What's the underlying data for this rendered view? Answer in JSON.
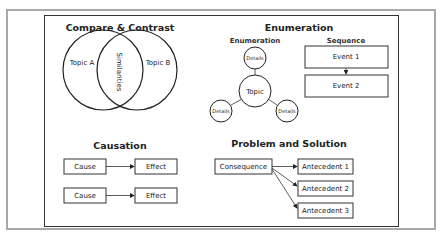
{
  "compare_contrast": {
    "title": "Compare & Contrast",
    "left_label": "Topic A",
    "right_label": "Topic B",
    "overlap_label": "Similarities"
  },
  "enumeration_section": {
    "title": "Enumeration",
    "enumeration": {
      "subtitle": "Enumeration",
      "center": "Topic",
      "details": [
        "Details",
        "Details",
        "Details"
      ]
    },
    "sequence": {
      "subtitle": "Sequence",
      "events": [
        "Event 1",
        "Event 2"
      ]
    }
  },
  "causation": {
    "title": "Causation",
    "rows": [
      {
        "cause": "Cause",
        "effect": "Effect"
      },
      {
        "cause": "Cause",
        "effect": "Effect"
      }
    ]
  },
  "problem_solution": {
    "title": "Problem and Solution",
    "consequence": "Consequence",
    "antecedents": [
      "Antecedent 1",
      "Antecedent 2",
      "Antecedent 3"
    ]
  },
  "colors": {
    "outer_frame": "#a8a8a8",
    "line": "#333333",
    "background": "#ffffff"
  }
}
